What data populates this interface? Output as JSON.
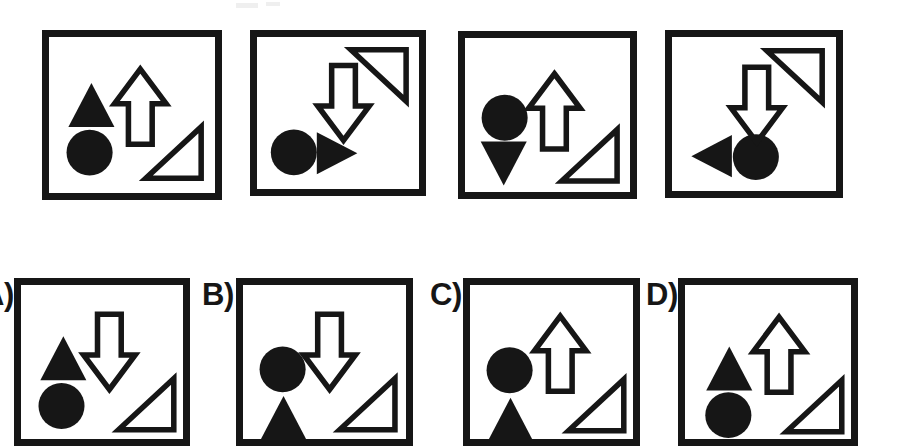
{
  "figure": {
    "title": "",
    "kind": "abstract-reasoning-matrix",
    "background_color": "#ffffff",
    "ink_color": "#161616",
    "frame_stroke_px": 7,
    "shape_stroke_px": 6
  },
  "sequence": {
    "name": "problem-sequence",
    "count": 4,
    "panels": [
      {
        "id": "seq-1",
        "index": 1,
        "box": {
          "x": 42,
          "y": 30,
          "w": 180,
          "h": 170
        },
        "shapes": [
          {
            "name": "filled-triangle-up",
            "type": "triangle",
            "direction": "up",
            "fill": "solid",
            "cx": 46,
            "cy": 74,
            "w": 50,
            "h": 48
          },
          {
            "name": "filled-circle",
            "type": "circle",
            "fill": "solid",
            "cx": 44,
            "cy": 126,
            "r": 25
          },
          {
            "name": "outline-arrow-up",
            "type": "arrow",
            "direction": "up",
            "fill": "outline",
            "cx": 99,
            "cy": 76,
            "w": 56,
            "h": 82
          },
          {
            "name": "outline-right-triangle",
            "type": "right-triangle",
            "orientation": "bottom-right",
            "fill": "outline",
            "cx": 135,
            "cy": 126,
            "w": 60,
            "h": 56
          }
        ]
      },
      {
        "id": "seq-2",
        "index": 2,
        "box": {
          "x": 250,
          "y": 30,
          "w": 176,
          "h": 166
        },
        "shapes": [
          {
            "name": "filled-circle",
            "type": "circle",
            "fill": "solid",
            "cx": 40,
            "cy": 126,
            "r": 25
          },
          {
            "name": "filled-triangle-right",
            "type": "triangle",
            "direction": "right",
            "fill": "solid",
            "cx": 87,
            "cy": 127,
            "w": 44,
            "h": 46
          },
          {
            "name": "outline-arrow-down",
            "type": "arrow",
            "direction": "down",
            "fill": "outline",
            "cx": 94,
            "cy": 72,
            "w": 56,
            "h": 82
          },
          {
            "name": "outline-right-triangle",
            "type": "right-triangle",
            "orientation": "top-right",
            "fill": "outline",
            "cx": 132,
            "cy": 42,
            "w": 60,
            "h": 56
          }
        ]
      },
      {
        "id": "seq-3",
        "index": 3,
        "box": {
          "x": 458,
          "y": 31,
          "w": 179,
          "h": 168
        },
        "shapes": [
          {
            "name": "filled-circle",
            "type": "circle",
            "fill": "solid",
            "cx": 43,
            "cy": 87,
            "r": 25
          },
          {
            "name": "filled-triangle-down",
            "type": "triangle",
            "direction": "down",
            "fill": "solid",
            "cx": 42,
            "cy": 137,
            "w": 50,
            "h": 48
          },
          {
            "name": "outline-arrow-up",
            "type": "arrow",
            "direction": "up",
            "fill": "outline",
            "cx": 97,
            "cy": 80,
            "w": 56,
            "h": 82
          },
          {
            "name": "outline-right-triangle",
            "type": "right-triangle",
            "orientation": "bottom-right",
            "fill": "outline",
            "cx": 135,
            "cy": 128,
            "w": 60,
            "h": 56
          }
        ]
      },
      {
        "id": "seq-4",
        "index": 4,
        "box": {
          "x": 665,
          "y": 30,
          "w": 178,
          "h": 168
        },
        "shapes": [
          {
            "name": "filled-triangle-left",
            "type": "triangle",
            "direction": "left",
            "fill": "solid",
            "cx": 43,
            "cy": 130,
            "w": 44,
            "h": 46
          },
          {
            "name": "filled-circle",
            "type": "circle",
            "fill": "solid",
            "cx": 91,
            "cy": 131,
            "r": 25
          },
          {
            "name": "outline-arrow-down",
            "type": "arrow",
            "direction": "down",
            "fill": "outline",
            "cx": 92,
            "cy": 74,
            "w": 56,
            "h": 82
          },
          {
            "name": "outline-right-triangle",
            "type": "right-triangle",
            "orientation": "top-right",
            "fill": "outline",
            "cx": 133,
            "cy": 43,
            "w": 60,
            "h": 56
          }
        ]
      }
    ]
  },
  "options": {
    "name": "answer-options",
    "count": 4,
    "note_clipped": "bottom row is cropped by the image edge",
    "items": [
      {
        "id": "option-a",
        "label": "A)",
        "label_visible": false,
        "label_pos": {
          "x": -18,
          "y": 279
        },
        "box": {
          "x": 14,
          "y": 278,
          "w": 176,
          "h": 168
        },
        "shapes": [
          {
            "name": "filled-triangle-up",
            "type": "triangle",
            "direction": "up",
            "fill": "solid",
            "cx": 46,
            "cy": 80,
            "w": 50,
            "h": 48
          },
          {
            "name": "filled-circle",
            "type": "circle",
            "fill": "solid",
            "cx": 44,
            "cy": 132,
            "r": 25
          },
          {
            "name": "outline-arrow-down",
            "type": "arrow",
            "direction": "down",
            "fill": "outline",
            "cx": 96,
            "cy": 73,
            "w": 56,
            "h": 82
          },
          {
            "name": "outline-right-triangle",
            "type": "right-triangle",
            "orientation": "bottom-right",
            "fill": "outline",
            "cx": 136,
            "cy": 130,
            "w": 60,
            "h": 56
          }
        ]
      },
      {
        "id": "option-b",
        "label": "B)",
        "label_visible": true,
        "label_pos": {
          "x": 202,
          "y": 279
        },
        "box": {
          "x": 236,
          "y": 278,
          "w": 177,
          "h": 168
        },
        "shapes": [
          {
            "name": "filled-circle",
            "type": "circle",
            "fill": "solid",
            "cx": 43,
            "cy": 92,
            "r": 25
          },
          {
            "name": "filled-triangle-up",
            "type": "triangle",
            "direction": "up",
            "fill": "solid",
            "cx": 44,
            "cy": 145,
            "w": 50,
            "h": 48
          },
          {
            "name": "outline-arrow-down",
            "type": "arrow",
            "direction": "down",
            "fill": "outline",
            "cx": 94,
            "cy": 73,
            "w": 56,
            "h": 82
          },
          {
            "name": "outline-right-triangle",
            "type": "right-triangle",
            "orientation": "bottom-right",
            "fill": "outline",
            "cx": 135,
            "cy": 130,
            "w": 60,
            "h": 56
          }
        ]
      },
      {
        "id": "option-c",
        "label": "C)",
        "label_visible": true,
        "label_pos": {
          "x": 430,
          "y": 279
        },
        "box": {
          "x": 463,
          "y": 278,
          "w": 177,
          "h": 168
        },
        "shapes": [
          {
            "name": "filled-circle",
            "type": "circle",
            "fill": "solid",
            "cx": 43,
            "cy": 93,
            "r": 25
          },
          {
            "name": "filled-triangle-up",
            "type": "triangle",
            "direction": "up",
            "fill": "solid",
            "cx": 44,
            "cy": 147,
            "w": 50,
            "h": 48
          },
          {
            "name": "outline-arrow-up",
            "type": "arrow",
            "direction": "up",
            "fill": "outline",
            "cx": 98,
            "cy": 75,
            "w": 56,
            "h": 82
          },
          {
            "name": "outline-right-triangle",
            "type": "right-triangle",
            "orientation": "bottom-right",
            "fill": "outline",
            "cx": 137,
            "cy": 131,
            "w": 60,
            "h": 56
          }
        ]
      },
      {
        "id": "option-d",
        "label": "D)",
        "label_visible": true,
        "label_pos": {
          "x": 646,
          "y": 279
        },
        "box": {
          "x": 678,
          "y": 278,
          "w": 180,
          "h": 168
        },
        "shapes": [
          {
            "name": "filled-triangle-up",
            "type": "triangle",
            "direction": "up",
            "fill": "solid",
            "cx": 48,
            "cy": 91,
            "w": 50,
            "h": 48
          },
          {
            "name": "filled-circle",
            "type": "circle",
            "fill": "solid",
            "cx": 47,
            "cy": 142,
            "r": 25
          },
          {
            "name": "outline-arrow-up",
            "type": "arrow",
            "direction": "up",
            "fill": "outline",
            "cx": 102,
            "cy": 76,
            "w": 56,
            "h": 82
          },
          {
            "name": "outline-right-triangle",
            "type": "right-triangle",
            "orientation": "bottom-right",
            "fill": "outline",
            "cx": 140,
            "cy": 132,
            "w": 60,
            "h": 56
          }
        ]
      }
    ]
  },
  "artifacts": [
    {
      "name": "scan-speck",
      "x": 236,
      "y": 3,
      "w": 22,
      "h": 5
    },
    {
      "name": "scan-speck",
      "x": 266,
      "y": 2,
      "w": 14,
      "h": 4
    }
  ]
}
